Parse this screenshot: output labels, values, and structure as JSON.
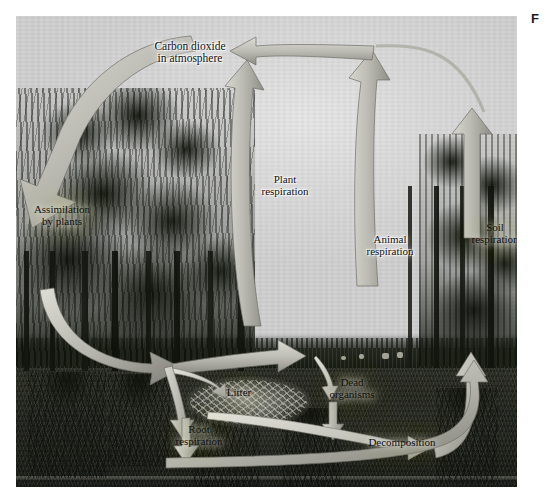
{
  "figure": {
    "marker": "F"
  },
  "diagram": {
    "labels": {
      "co2": [
        "Carbon dioxide",
        "in atmosphere"
      ],
      "assimilation": [
        "Assimilation",
        "by plants"
      ],
      "plant_respiration": [
        "Plant",
        "respiration"
      ],
      "animal_respiration": [
        "Animal",
        "respiration"
      ],
      "soil_respiration": [
        "Soil",
        "respiration"
      ],
      "litter": [
        "Litter"
      ],
      "dead_organisms": [
        "Dead",
        "organisms"
      ],
      "root_respiration": [
        "Root",
        "respiration"
      ],
      "decomposition": [
        "Decomposition"
      ]
    },
    "colors": {
      "arrow_fill_light": "#d7d7cf",
      "arrow_fill_mid": "#b0b0a8",
      "arrow_fill_dark": "#8e8e87",
      "arrow_outline": "#6e6e68",
      "sky": "#d4d4d4",
      "soil": "#262a21",
      "canopy": "#181c14",
      "plate_border": "#bfbfbf"
    },
    "scene": {
      "sky_region": "upper gray sky with soft bright patch",
      "horizon": "distant dark tree line across the middle",
      "ground_line_y": 352,
      "subsurface": "dark brown-black soil cross-section with root systems"
    },
    "flows": [
      {
        "id": "assimilation",
        "from": "Carbon dioxide in atmosphere",
        "to": "Plants (canopy)",
        "direction": "down-left"
      },
      {
        "id": "plant-respiration",
        "from": "Plants",
        "to": "Carbon dioxide in atmosphere",
        "direction": "up"
      },
      {
        "id": "animal-respiration",
        "from": "Animals",
        "to": "Carbon dioxide in atmosphere",
        "direction": "up"
      },
      {
        "id": "soil-respiration",
        "from": "Soil",
        "to": "Carbon dioxide in atmosphere",
        "direction": "up"
      },
      {
        "id": "plants-to-litter",
        "from": "Plants",
        "to": "Litter",
        "direction": "down"
      },
      {
        "id": "plants-to-roots",
        "from": "Plants",
        "to": "Roots",
        "direction": "down"
      },
      {
        "id": "plants-to-animals",
        "from": "Plants",
        "to": "Animals",
        "direction": "right"
      },
      {
        "id": "animals-to-dead",
        "from": "Animals",
        "to": "Dead organisms",
        "direction": "down"
      },
      {
        "id": "dead-to-decomp",
        "from": "Dead organisms",
        "to": "Decomposition",
        "direction": "down"
      },
      {
        "id": "litter-to-decomp",
        "from": "Litter",
        "to": "Decomposition",
        "direction": "right"
      },
      {
        "id": "root-respiration",
        "from": "Roots",
        "to": "Soil",
        "direction": "down"
      },
      {
        "id": "decomp-to-soil-resp",
        "from": "Decomposition",
        "to": "Soil respiration",
        "direction": "up-right"
      },
      {
        "id": "soil-loop-return",
        "from": "Deep soil",
        "to": "Soil respiration",
        "direction": "right"
      }
    ]
  }
}
